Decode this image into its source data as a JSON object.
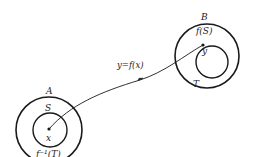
{
  "diagram": {
    "type": "function-mapping",
    "sets": {
      "A": {
        "label": "A",
        "inner_label": "S",
        "point_label": "x",
        "preimage_label": "f⁻¹(T)"
      },
      "B": {
        "label": "B",
        "inner_label": "f(S)",
        "point_label": "y",
        "subset_label": "T"
      }
    },
    "mapping_label": "y=f(x)",
    "colors": {
      "stroke": "#1a1a1a",
      "background": "#ffffff"
    }
  }
}
